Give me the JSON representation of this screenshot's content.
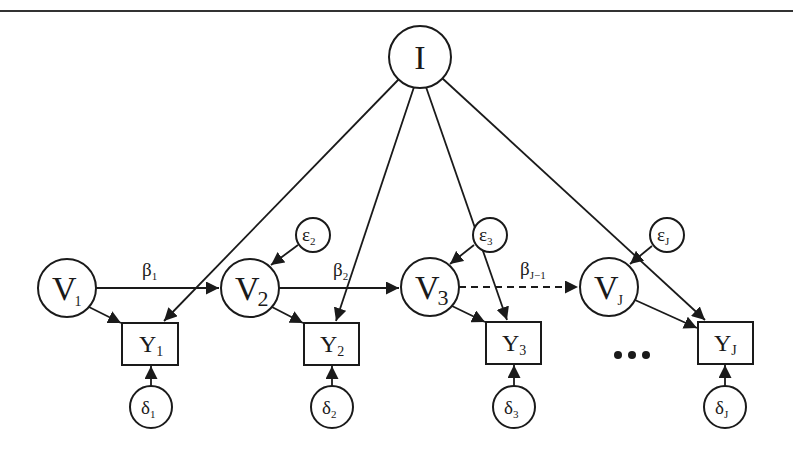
{
  "diagram": {
    "type": "path-diagram",
    "rule_color": "#333333",
    "ellipsis": "•••",
    "nodes": {
      "I": {
        "label": "I",
        "sub": ""
      },
      "V1": {
        "label": "V",
        "sub": "1"
      },
      "V2": {
        "label": "V",
        "sub": "2"
      },
      "V3": {
        "label": "V",
        "sub": "3"
      },
      "VJ": {
        "label": "V",
        "sub": "J"
      },
      "Y1": {
        "label": "Y",
        "sub": "1"
      },
      "Y2": {
        "label": "Y",
        "sub": "2"
      },
      "Y3": {
        "label": "Y",
        "sub": "3"
      },
      "YJ": {
        "label": "Y",
        "sub": "J"
      },
      "e2": {
        "label": "ε",
        "sub": "2"
      },
      "e3": {
        "label": "ε",
        "sub": "3"
      },
      "eJ": {
        "label": "ε",
        "sub": "J"
      },
      "d1": {
        "label": "δ",
        "sub": "1"
      },
      "d2": {
        "label": "δ",
        "sub": "2"
      },
      "d3": {
        "label": "δ",
        "sub": "3"
      },
      "dJ": {
        "label": "δ",
        "sub": "J"
      }
    },
    "edge_labels": {
      "b1": {
        "label": "β",
        "sub": "1"
      },
      "b2": {
        "label": "β",
        "sub": "2"
      },
      "bJ1": {
        "label": "β",
        "sub": "J−1"
      }
    },
    "edges": [
      {
        "from": "V1",
        "to": "V2",
        "label": "β1",
        "style": "solid"
      },
      {
        "from": "V2",
        "to": "V3",
        "label": "β2",
        "style": "solid"
      },
      {
        "from": "V3",
        "to": "VJ",
        "label": "βJ−1",
        "style": "dashed"
      },
      {
        "from": "I",
        "to": "Y1"
      },
      {
        "from": "I",
        "to": "Y2"
      },
      {
        "from": "I",
        "to": "Y3"
      },
      {
        "from": "I",
        "to": "YJ"
      },
      {
        "from": "V1",
        "to": "Y1"
      },
      {
        "from": "V2",
        "to": "Y2"
      },
      {
        "from": "V3",
        "to": "Y3"
      },
      {
        "from": "VJ",
        "to": "YJ"
      },
      {
        "from": "e2",
        "to": "V2"
      },
      {
        "from": "e3",
        "to": "V3"
      },
      {
        "from": "eJ",
        "to": "VJ"
      },
      {
        "from": "d1",
        "to": "Y1"
      },
      {
        "from": "d2",
        "to": "Y2"
      },
      {
        "from": "d3",
        "to": "Y3"
      },
      {
        "from": "dJ",
        "to": "YJ"
      }
    ]
  }
}
